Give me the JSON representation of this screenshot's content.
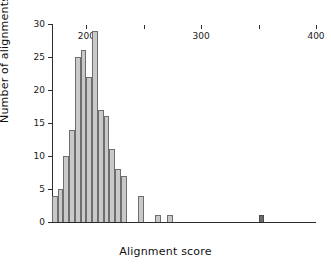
{
  "chart_data": {
    "type": "bar",
    "title": "",
    "xlabel": "Alignment score",
    "ylabel": "Number of alignments",
    "xlim": [
      170,
      400
    ],
    "ylim": [
      0,
      30
    ],
    "bin_width": 5,
    "grid": false,
    "legend": null,
    "xticks": [
      200,
      250,
      300,
      350,
      400
    ],
    "xtick_labels": [
      "200",
      "",
      "300",
      "",
      "400"
    ],
    "yticks": [
      0,
      5,
      10,
      15,
      20,
      25,
      30
    ],
    "ytick_labels": [
      "0",
      "5",
      "10",
      "15",
      "20",
      "25",
      "30"
    ],
    "colors": {
      "bar_fill": "#c9c9c9",
      "bar_edge": "#6e6e6e",
      "highlight_fill": "#6a6a6a",
      "axis": "#2b2b2b",
      "text": "#111111"
    },
    "categories": [
      172,
      177,
      182,
      187,
      192,
      197,
      202,
      207,
      212,
      217,
      222,
      227,
      232,
      247,
      262,
      272,
      352
    ],
    "values": [
      4,
      5,
      10,
      14,
      25,
      26,
      22,
      29,
      17,
      16,
      11,
      8,
      7,
      4,
      1,
      1,
      1
    ],
    "bars": [
      {
        "x0": 170,
        "x1": 175,
        "value": 4,
        "highlight": false
      },
      {
        "x0": 175,
        "x1": 180,
        "value": 5,
        "highlight": false
      },
      {
        "x0": 180,
        "x1": 185,
        "value": 10,
        "highlight": false
      },
      {
        "x0": 185,
        "x1": 190,
        "value": 14,
        "highlight": false
      },
      {
        "x0": 190,
        "x1": 195,
        "value": 25,
        "highlight": false
      },
      {
        "x0": 195,
        "x1": 200,
        "value": 26,
        "highlight": false
      },
      {
        "x0": 200,
        "x1": 205,
        "value": 22,
        "highlight": false
      },
      {
        "x0": 205,
        "x1": 210,
        "value": 29,
        "highlight": false
      },
      {
        "x0": 210,
        "x1": 215,
        "value": 17,
        "highlight": false
      },
      {
        "x0": 215,
        "x1": 220,
        "value": 16,
        "highlight": false
      },
      {
        "x0": 220,
        "x1": 225,
        "value": 11,
        "highlight": false
      },
      {
        "x0": 225,
        "x1": 230,
        "value": 8,
        "highlight": false
      },
      {
        "x0": 230,
        "x1": 235,
        "value": 7,
        "highlight": false
      },
      {
        "x0": 245,
        "x1": 250,
        "value": 4,
        "highlight": false
      },
      {
        "x0": 260,
        "x1": 265,
        "value": 1,
        "highlight": false
      },
      {
        "x0": 270,
        "x1": 275,
        "value": 1,
        "highlight": false
      },
      {
        "x0": 350,
        "x1": 355,
        "value": 1,
        "highlight": true
      }
    ]
  }
}
